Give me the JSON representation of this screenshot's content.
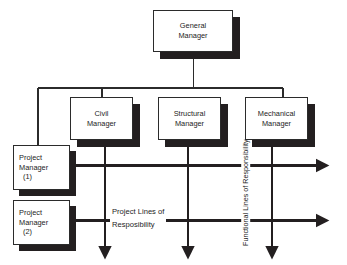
{
  "diagram": {
    "colors": {
      "line": "#2b2b2b",
      "shadow": "#231f20",
      "box_fill": "#ffffff",
      "text": "#1d1d1d",
      "background": "#ffffff"
    },
    "boxes": [
      {
        "id": "general-manager",
        "line1": "General",
        "line2": "Manager",
        "line3": "",
        "align": "centered"
      },
      {
        "id": "civil-manager",
        "line1": "Civil",
        "line2": "Manager",
        "line3": "",
        "align": "centered"
      },
      {
        "id": "structural-manager",
        "line1": "Structural",
        "line2": "Manager",
        "line3": "",
        "align": "centered"
      },
      {
        "id": "mechanical-manager",
        "line1": "Mechanical",
        "line2": "Manager",
        "line3": "",
        "align": "centered"
      },
      {
        "id": "project-manager-1",
        "line1": "Project",
        "line2": "Manager",
        "line3": "(1)",
        "align": "lefty"
      },
      {
        "id": "project-manager-2",
        "line1": "Project",
        "line2": "Manager",
        "line3": "(2)",
        "align": "lefty"
      }
    ],
    "labels": {
      "project_lines_line1": "Project Lines of",
      "project_lines_line2": "Resposibility",
      "functional_lines_line1": "Functional Lines",
      "functional_lines_line2": "of Responsibility"
    }
  }
}
